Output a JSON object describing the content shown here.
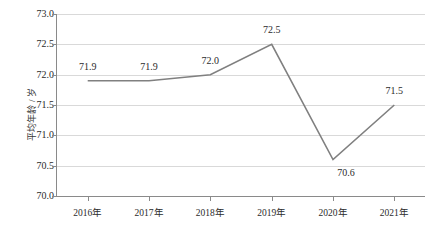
{
  "chart_data": {
    "type": "line",
    "title": "",
    "subtitle": "",
    "xlabel": "",
    "ylabel": "平均年龄 / 岁",
    "categories": [
      "2016年",
      "2017年",
      "2018年",
      "2019年",
      "2020年",
      "2021年"
    ],
    "values": [
      71.9,
      71.9,
      72.0,
      72.5,
      70.6,
      71.5
    ],
    "data_labels": [
      "71.9",
      "71.9",
      "72.0",
      "72.5",
      "70.6",
      "71.5"
    ],
    "series": [
      {
        "name": "平均年龄",
        "values": [
          71.9,
          71.9,
          72.0,
          72.5,
          70.6,
          71.5
        ],
        "color": "#808080"
      }
    ],
    "ylim": [
      70.0,
      73.0
    ],
    "ytick_step": 0.5,
    "ytick_labels": [
      "73.0",
      "72.5",
      "72.0",
      "71.5",
      "71.0",
      "70.5",
      "70.0"
    ],
    "ytick_values": [
      73.0,
      72.5,
      72.0,
      71.5,
      71.0,
      70.5,
      70.0
    ],
    "grid": true,
    "grid_orientation": "horizontal",
    "grid_color": "#d9d9d9",
    "axis_color": "#8a8a8a",
    "legend": false,
    "legend_position": "none",
    "markers": false,
    "line_color": "#808080",
    "line_width": 1.6,
    "background": "#ffffff"
  },
  "labels": {
    "y_axis_title": "平均年龄 / 岁",
    "y_ticks": [
      "73.0",
      "72.5",
      "72.0",
      "71.5",
      "71.0",
      "70.5",
      "70.0"
    ],
    "x_ticks": [
      "2016年",
      "2017年",
      "2018年",
      "2019年",
      "2020年",
      "2021年"
    ],
    "point_labels": [
      "71.9",
      "71.9",
      "72.0",
      "72.5",
      "70.6",
      "71.5"
    ]
  }
}
